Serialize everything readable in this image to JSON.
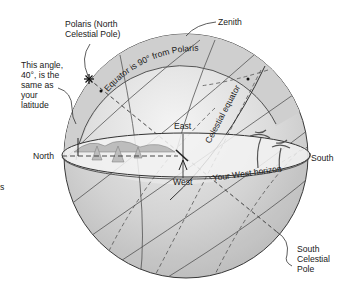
{
  "diagram": {
    "labels": {
      "polaris": "Polaris (North\nCelestial Pole)",
      "zenith": "Zenith",
      "angle_note": "This angle,\n40°, is the\nsame as\nyour\nlatitude",
      "equator_band": "Equator is 90° from Polaris",
      "celestial_equator": "Celestial equator",
      "east": "East",
      "west": "West",
      "north": "North",
      "south": "South",
      "west_horizon": "Your West horizon",
      "south_pole": "South\nCelestial\nPole",
      "left_edge_fragment": "s"
    },
    "latitude_deg": 40,
    "colors": {
      "sphere_fill": "#d9d9d9",
      "band_fill": "#c8c8c8",
      "line": "#333333",
      "background": "#ffffff"
    }
  }
}
